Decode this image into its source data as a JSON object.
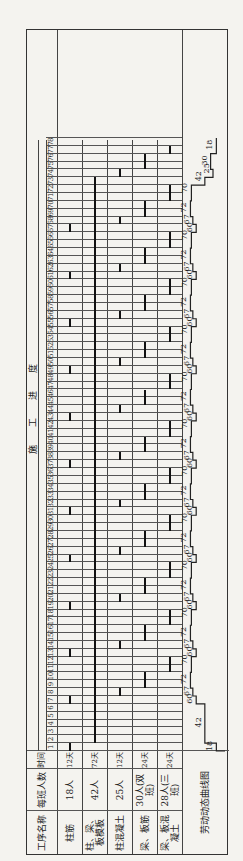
{
  "table": {
    "headers": {
      "process_name": "工序名称",
      "crew_size": "每班人数",
      "duration": "时间",
      "progress_title": "施工进度"
    },
    "days": [
      "1",
      "2",
      "3",
      "4",
      "5",
      "6",
      "7",
      "8",
      "9",
      "10",
      "11",
      "12",
      "13",
      "14",
      "15",
      "16",
      "17",
      "18",
      "19",
      "20",
      "21",
      "22",
      "23",
      "24",
      "25",
      "26",
      "27",
      "28",
      "29",
      "30",
      "31",
      "32",
      "33",
      "34",
      "35",
      "36",
      "37",
      "38",
      "39",
      "40",
      "41",
      "42",
      "43",
      "44",
      "45",
      "46",
      "47",
      "48",
      "49",
      "50",
      "51",
      "52",
      "53",
      "54",
      "55",
      "56",
      "57",
      "58",
      "59",
      "60",
      "61",
      "62",
      "63",
      "64",
      "65",
      "66",
      "67",
      "68",
      "69",
      "70",
      "71",
      "72",
      "73",
      "74",
      "75",
      "76",
      "77",
      "78"
    ],
    "rows": [
      {
        "process": "柱筋",
        "crew": "18人",
        "duration": "12天"
      },
      {
        "process": "柱、梁、板模板",
        "crew": "42人",
        "duration": "72天"
      },
      {
        "process": "柱混凝土",
        "crew": "25人",
        "duration": "12天"
      },
      {
        "process": "梁、板筋",
        "crew": "30人(双班)",
        "duration": "24天"
      },
      {
        "process": "梁、板混凝土",
        "crew": "28人(三班)",
        "duration": "24天"
      }
    ],
    "labor_curve_label": "劳动动态曲线图"
  },
  "chart_data": {
    "type": "table",
    "title": "施工进度",
    "xlabel": "天",
    "ylabel": "每班人数",
    "tasks": [
      {
        "name": "柱筋",
        "crew": 18,
        "segments": [
          [
            1,
            2
          ],
          [
            7,
            8
          ],
          [
            13,
            14
          ],
          [
            19,
            20
          ],
          [
            25,
            26
          ],
          [
            31,
            32
          ],
          [
            37,
            38
          ],
          [
            43,
            44
          ],
          [
            49,
            50
          ],
          [
            55,
            56
          ],
          [
            61,
            62
          ],
          [
            67,
            68
          ]
        ]
      },
      {
        "name": "柱、梁、板模板",
        "crew": 42,
        "segments": [
          [
            2,
            74
          ]
        ]
      },
      {
        "name": "柱混凝土",
        "crew": 25,
        "segments": [
          [
            8,
            9
          ],
          [
            14,
            15
          ],
          [
            20,
            21
          ],
          [
            26,
            27
          ],
          [
            32,
            33
          ],
          [
            38,
            39
          ],
          [
            44,
            45
          ],
          [
            50,
            51
          ],
          [
            56,
            57
          ],
          [
            62,
            63
          ],
          [
            68,
            69
          ],
          [
            74,
            75
          ]
        ]
      },
      {
        "name": "梁、板筋",
        "crew": 30,
        "segments": [
          [
            9,
            11
          ],
          [
            15,
            17
          ],
          [
            21,
            23
          ],
          [
            27,
            29
          ],
          [
            33,
            35
          ],
          [
            39,
            41
          ],
          [
            45,
            47
          ],
          [
            51,
            53
          ],
          [
            57,
            59
          ],
          [
            63,
            65
          ],
          [
            69,
            71
          ],
          [
            75,
            77
          ]
        ]
      },
      {
        "name": "梁、板混凝土",
        "crew": 28,
        "segments": [
          [
            11,
            13
          ],
          [
            17,
            19
          ],
          [
            23,
            25
          ],
          [
            29,
            31
          ],
          [
            35,
            37
          ],
          [
            41,
            43
          ],
          [
            47,
            49
          ],
          [
            53,
            55
          ],
          [
            59,
            61
          ],
          [
            65,
            67
          ],
          [
            71,
            73
          ],
          [
            77,
            78
          ]
        ]
      }
    ],
    "labor_curve": {
      "labels": [
        "18",
        "42",
        "60",
        "67",
        "72",
        "70",
        "60",
        "67",
        "72",
        "70",
        "60",
        "67",
        "72",
        "70",
        "60",
        "67",
        "72",
        "70",
        "60",
        "67",
        "72",
        "70",
        "60",
        "67",
        "72",
        "70",
        "60",
        "67",
        "72",
        "70",
        "60",
        "67",
        "72",
        "70",
        "60",
        "67",
        "72",
        "70",
        "42",
        "25",
        "30",
        "18"
      ]
    },
    "xlim": [
      1,
      78
    ]
  },
  "labor_labels": [
    {
      "day": 1,
      "text": "18"
    },
    {
      "day": 4,
      "text": "42"
    },
    {
      "day": 7,
      "text": "60"
    },
    {
      "day": 8,
      "text": "67"
    },
    {
      "day": 9.5,
      "text": "72"
    },
    {
      "day": 12,
      "text": "70"
    },
    {
      "day": 13,
      "text": "60"
    },
    {
      "day": 14,
      "text": "67"
    },
    {
      "day": 15.5,
      "text": "72"
    },
    {
      "day": 18,
      "text": "70"
    },
    {
      "day": 19,
      "text": "60"
    },
    {
      "day": 20,
      "text": "67"
    },
    {
      "day": 21.5,
      "text": "72"
    },
    {
      "day": 24,
      "text": "70"
    },
    {
      "day": 25,
      "text": "60"
    },
    {
      "day": 26,
      "text": "67"
    },
    {
      "day": 27.5,
      "text": "72"
    },
    {
      "day": 30,
      "text": "70"
    },
    {
      "day": 31,
      "text": "60"
    },
    {
      "day": 32,
      "text": "67"
    },
    {
      "day": 33.5,
      "text": "72"
    },
    {
      "day": 36,
      "text": "70"
    },
    {
      "day": 37,
      "text": "60"
    },
    {
      "day": 38,
      "text": "67"
    },
    {
      "day": 39.5,
      "text": "72"
    },
    {
      "day": 42,
      "text": "70"
    },
    {
      "day": 43,
      "text": "60"
    },
    {
      "day": 44,
      "text": "67"
    },
    {
      "day": 45.5,
      "text": "72"
    },
    {
      "day": 48,
      "text": "70"
    },
    {
      "day": 49,
      "text": "60"
    },
    {
      "day": 50,
      "text": "67"
    },
    {
      "day": 51.5,
      "text": "72"
    },
    {
      "day": 54,
      "text": "70"
    },
    {
      "day": 55,
      "text": "60"
    },
    {
      "day": 56,
      "text": "67"
    },
    {
      "day": 57.5,
      "text": "72"
    },
    {
      "day": 60,
      "text": "70"
    },
    {
      "day": 61,
      "text": "60"
    },
    {
      "day": 62,
      "text": "67"
    },
    {
      "day": 63.5,
      "text": "72"
    },
    {
      "day": 66,
      "text": "70"
    },
    {
      "day": 67,
      "text": "60"
    },
    {
      "day": 68,
      "text": "67"
    },
    {
      "day": 69.5,
      "text": "72"
    },
    {
      "day": 72,
      "text": "70"
    },
    {
      "day": 73.5,
      "text": "42"
    },
    {
      "day": 74.5,
      "text": "25"
    },
    {
      "day": 75.5,
      "text": "30"
    },
    {
      "day": 77.5,
      "text": "18"
    }
  ]
}
